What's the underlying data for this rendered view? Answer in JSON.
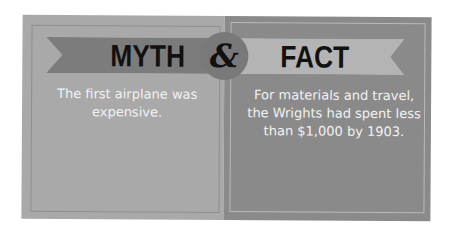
{
  "myth": {
    "title": "MYTH",
    "statement": "The first airplane was expensive."
  },
  "connector": {
    "symbol": "&"
  },
  "fact": {
    "title": "FACT",
    "statement": "For materials and travel, the Wrights had spent less than $1,000 by 1903."
  },
  "colors": {
    "myth_panel": "#a9a9a9",
    "fact_panel": "#8a8a8a",
    "myth_ribbon": "#7c7c7c",
    "fact_ribbon": "#b4b4b4",
    "circle": "#797979",
    "title_text": "#111111",
    "body_text": "#f2f2f2"
  }
}
